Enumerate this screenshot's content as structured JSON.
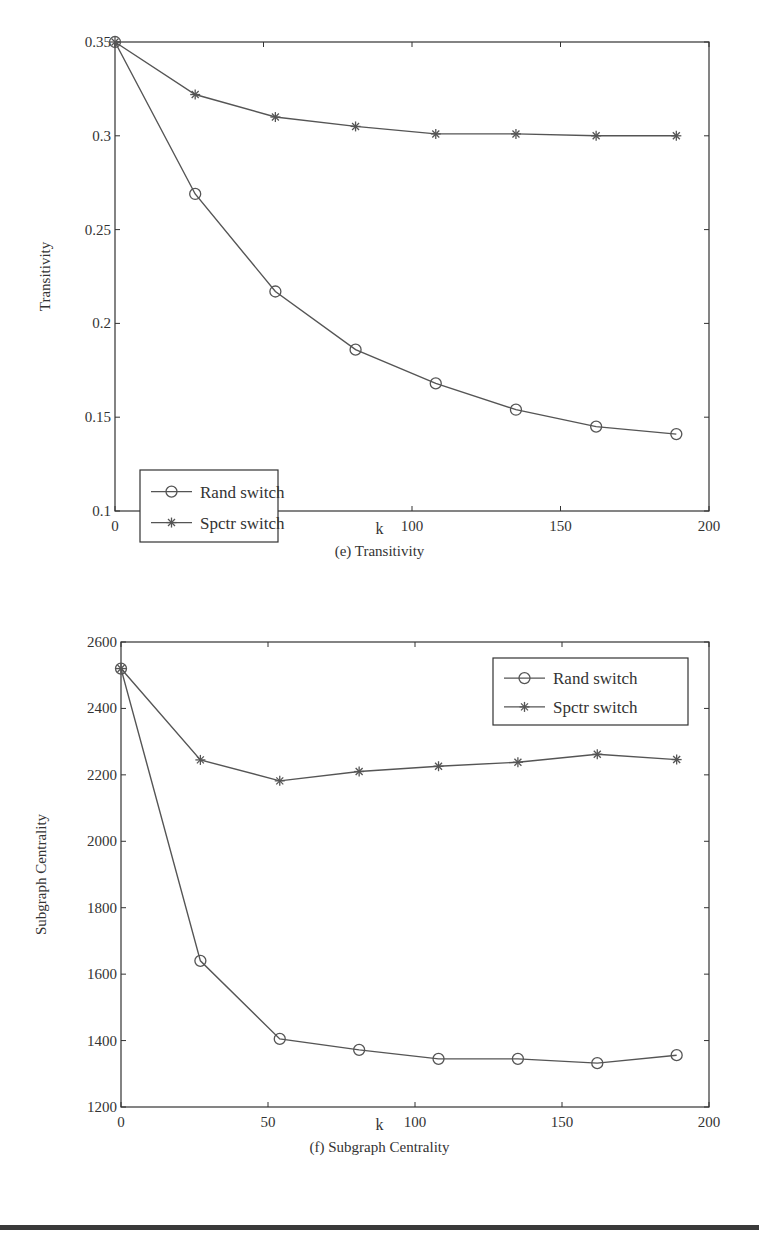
{
  "chart_data": [
    {
      "id": "e",
      "type": "line",
      "title": "(e) Transitivity",
      "xlabel": "k",
      "ylabel": "Transitivity",
      "xlim": [
        0,
        200
      ],
      "ylim": [
        0.1,
        0.35
      ],
      "xticks": [
        0,
        50,
        100,
        150,
        200
      ],
      "yticks": [
        0.1,
        0.15,
        0.2,
        0.25,
        0.3,
        0.35
      ],
      "ytick_labels": [
        "0.1",
        "0.15",
        "0.2",
        "0.25",
        "0.3",
        "0.35"
      ],
      "grid": false,
      "legend_position": "lower left",
      "x": [
        0,
        27,
        54,
        81,
        108,
        135,
        162,
        189
      ],
      "series": [
        {
          "name": "Rand switch",
          "marker": "circle",
          "values": [
            0.35,
            0.269,
            0.217,
            0.186,
            0.168,
            0.154,
            0.145,
            0.141
          ]
        },
        {
          "name": "Spctr switch",
          "marker": "asterisk",
          "values": [
            0.35,
            0.322,
            0.31,
            0.305,
            0.301,
            0.301,
            0.3,
            0.3
          ]
        }
      ]
    },
    {
      "id": "f",
      "type": "line",
      "title": "(f) Subgraph Centrality",
      "xlabel": "k",
      "ylabel": "Subgraph Centrality",
      "xlim": [
        0,
        200
      ],
      "ylim": [
        1200,
        2600
      ],
      "xticks": [
        0,
        50,
        100,
        150,
        200
      ],
      "yticks": [
        1200,
        1400,
        1600,
        1800,
        2000,
        2200,
        2400,
        2600
      ],
      "ytick_labels": [
        "1200",
        "1400",
        "1600",
        "1800",
        "2000",
        "2200",
        "2400",
        "2600"
      ],
      "grid": false,
      "legend_position": "upper right",
      "x": [
        0,
        27,
        54,
        81,
        108,
        135,
        162,
        189
      ],
      "series": [
        {
          "name": "Rand switch",
          "marker": "circle",
          "values": [
            2520,
            1640,
            1405,
            1372,
            1345,
            1345,
            1332,
            1356
          ]
        },
        {
          "name": "Spctr switch",
          "marker": "asterisk",
          "values": [
            2520,
            2245,
            2182,
            2210,
            2226,
            2238,
            2262,
            2246
          ]
        }
      ]
    }
  ],
  "figures": {
    "e": {
      "caption": "(e) Transitivity",
      "xlabel": "k",
      "ylabel": "Transitivity"
    },
    "f": {
      "caption": "(f) Subgraph Centrality",
      "xlabel": "k",
      "ylabel": "Subgraph Centrality"
    }
  },
  "colors": {
    "line": "#555555",
    "axis": "#333333",
    "text": "#333333",
    "rule": "#3a3a3a"
  }
}
